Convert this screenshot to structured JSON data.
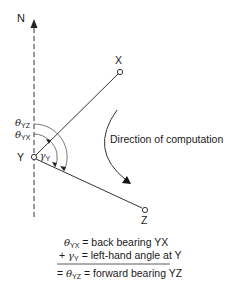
{
  "diagram": {
    "north_label": "N",
    "points": {
      "X": "X",
      "Y": "Y",
      "Z": "Z"
    },
    "angles": {
      "theta_yz": {
        "symbol": "θ",
        "sub": "YZ"
      },
      "theta_yx": {
        "symbol": "θ",
        "sub": "YX"
      },
      "gamma_y": {
        "symbol": "γ",
        "sub": "Y"
      }
    },
    "direction_label": "Direction of computation",
    "equations": {
      "line1": {
        "symbol": "θ",
        "sub": "YX",
        "text": " = back bearing YX"
      },
      "line2": {
        "prefix": "+ ",
        "symbol": "γ",
        "sub": "Y",
        "text": " = left-hand angle at Y"
      },
      "line3": {
        "prefix": "= ",
        "symbol": "θ",
        "sub": "YZ",
        "text": " = forward bearing YZ"
      }
    },
    "colors": {
      "line": "#333333",
      "text": "#1a1a1a"
    }
  }
}
